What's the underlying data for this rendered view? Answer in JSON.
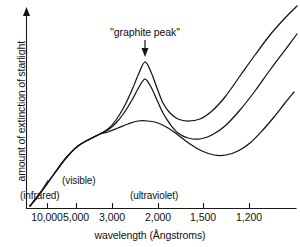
{
  "figure": {
    "background_color": "#ffffff",
    "ink_color": "#141414"
  },
  "axes": {
    "x_title": "wavelength  (Ångstroms)",
    "y_title": "amount of extinction of starlight",
    "y_arrow_icon": "up-arrow-icon",
    "x_tick_labels": [
      "10,000",
      "5,000",
      "3,000",
      "2,000",
      "1,500",
      "1,200"
    ]
  },
  "annotations": {
    "peak_label": "''graphite peak''",
    "peak_arrow_icon": "down-arrow-icon",
    "regions": [
      {
        "name": "infrared",
        "label": "(infrared)"
      },
      {
        "name": "visible",
        "label": "(visible)"
      },
      {
        "name": "ultraviolet",
        "label": "(ultraviolet)"
      }
    ]
  },
  "chart_data": {
    "type": "line",
    "title": "",
    "xlabel": "wavelength  (Ångstroms)",
    "ylabel": "amount of extinction of starlight",
    "grid": false,
    "legend": "none",
    "x_axis": {
      "label": "wavelength  (Ångstroms)",
      "tick_labels": [
        "10,000",
        "5,000",
        "3,000",
        "2,000",
        "1,500",
        "1,200"
      ],
      "tick_values": [
        10000,
        5000,
        3000,
        2000,
        1500,
        1200
      ],
      "tick_pixel_x": [
        47,
        76,
        112,
        158,
        203,
        249
      ],
      "direction": "decreasing wavelength to the right",
      "scale": "inverse-wavelength (1/lambda) linear"
    },
    "y_axis": {
      "label": "amount of extinction of starlight",
      "ticks": [],
      "note": "qualitative axis, increases upward, arrow at top, no numeric ticks"
    },
    "spectral_regions": [
      {
        "name": "infrared",
        "label": "(infrared)",
        "pixel_x": 20,
        "pixel_y": 191
      },
      {
        "name": "visible",
        "label": "(visible)",
        "pixel_x": 62,
        "pixel_y": 176
      },
      {
        "name": "ultraviolet",
        "label": "(ultraviolet)",
        "pixel_x": 130,
        "pixel_y": 191
      }
    ],
    "annotation": {
      "text": "''graphite peak''",
      "points_to": {
        "pixel_x": 145,
        "pixel_y": 62
      },
      "wavelength_angstroms": 2175
    },
    "series": [
      {
        "name": "curve-1-strong-bump",
        "description": "strongest 2175 A graphite bump, highest far-UV rise",
        "points_pixel": [
          [
            30,
            206
          ],
          [
            41,
            192
          ],
          [
            54,
            174
          ],
          [
            66,
            158
          ],
          [
            78,
            146
          ],
          [
            90,
            139
          ],
          [
            100,
            134
          ],
          [
            108,
            129
          ],
          [
            116,
            120
          ],
          [
            124,
            107
          ],
          [
            132,
            90
          ],
          [
            139,
            73
          ],
          [
            145,
            62
          ],
          [
            151,
            72
          ],
          [
            157,
            88
          ],
          [
            163,
            103
          ],
          [
            170,
            113
          ],
          [
            178,
            119
          ],
          [
            188,
            121
          ],
          [
            200,
            119
          ],
          [
            212,
            111
          ],
          [
            225,
            97
          ],
          [
            240,
            76
          ],
          [
            255,
            55
          ],
          [
            270,
            35
          ],
          [
            285,
            18
          ],
          [
            297,
            6
          ]
        ]
      },
      {
        "name": "curve-2-medium-bump",
        "description": "intermediate bump strength and intermediate far-UV rise",
        "points_pixel": [
          [
            30,
            206
          ],
          [
            41,
            192
          ],
          [
            54,
            174
          ],
          [
            66,
            158
          ],
          [
            78,
            146
          ],
          [
            90,
            139
          ],
          [
            100,
            134
          ],
          [
            108,
            130
          ],
          [
            116,
            123
          ],
          [
            124,
            113
          ],
          [
            132,
            100
          ],
          [
            139,
            87
          ],
          [
            145,
            79
          ],
          [
            151,
            87
          ],
          [
            157,
            100
          ],
          [
            163,
            113
          ],
          [
            170,
            124
          ],
          [
            178,
            133
          ],
          [
            188,
            138
          ],
          [
            200,
            139
          ],
          [
            212,
            135
          ],
          [
            225,
            126
          ],
          [
            240,
            110
          ],
          [
            255,
            91
          ],
          [
            270,
            70
          ],
          [
            285,
            50
          ],
          [
            297,
            34
          ]
        ]
      },
      {
        "name": "curve-3-weak-bump",
        "description": "weakest, broad shallow bump and flattest far-UV rise",
        "points_pixel": [
          [
            30,
            206
          ],
          [
            41,
            192
          ],
          [
            54,
            174
          ],
          [
            66,
            158
          ],
          [
            78,
            146
          ],
          [
            90,
            139
          ],
          [
            100,
            134
          ],
          [
            108,
            132
          ],
          [
            118,
            128
          ],
          [
            128,
            124
          ],
          [
            138,
            121
          ],
          [
            148,
            121
          ],
          [
            158,
            123
          ],
          [
            168,
            128
          ],
          [
            178,
            135
          ],
          [
            190,
            144
          ],
          [
            202,
            151
          ],
          [
            214,
            155
          ],
          [
            226,
            155
          ],
          [
            238,
            151
          ],
          [
            250,
            143
          ],
          [
            262,
            131
          ],
          [
            274,
            117
          ],
          [
            285,
            103
          ],
          [
            294,
            92
          ]
        ]
      }
    ]
  }
}
